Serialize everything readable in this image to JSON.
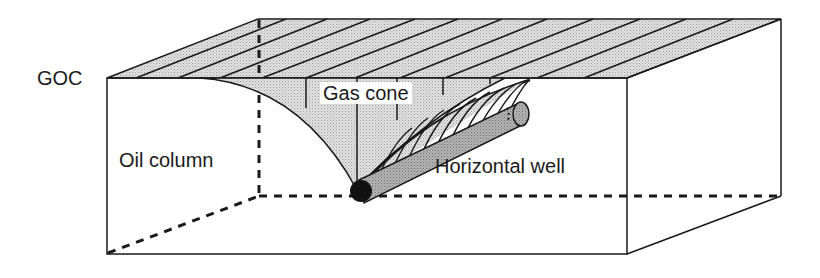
{
  "diagram": {
    "type": "3d-block-cross-section",
    "labels": {
      "goc": "GOC",
      "gas_cone": "Gas cone",
      "oil_column": "Oil column",
      "horizontal_well": "Horizontal well"
    },
    "colors": {
      "line": "#1a1a1a",
      "gas_fill": "#d9d9d9",
      "well_fill": "#a8a8a8",
      "well_end": "#111111",
      "background": "#ffffff"
    }
  }
}
